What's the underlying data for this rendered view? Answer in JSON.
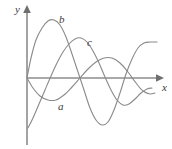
{
  "figure": {
    "title": "",
    "background_color": "#ffffff",
    "axis_color": "#8c8c8c",
    "curve_color": "#8a8a8a",
    "label_color": "#3a3a3a"
  },
  "axes": {
    "x_label": "x",
    "y_label": "y",
    "origin": {
      "x": 27,
      "y": 78
    },
    "x_axis": {
      "start_x": 27,
      "end_x": 163,
      "y": 78,
      "arrow": "right"
    },
    "y_axis": {
      "x": 27,
      "start_y": 145,
      "end_y": 8,
      "arrow": "up"
    }
  },
  "chart_data": {
    "type": "line",
    "title": "",
    "xlabel": "x",
    "ylabel": "y",
    "grid": false,
    "legend": "inline-curve-labels",
    "xlim": [
      0,
      1
    ],
    "ylim": [
      -1,
      1
    ],
    "series": [
      {
        "name": "a",
        "label": "a",
        "label_position": {
          "x": 62,
          "y": 107
        },
        "description": "sine-like curve starting at the origin, first dipping below the x-axis, then rising to a positive hump and decaying toward the right",
        "points_px": [
          [
            27,
            78
          ],
          [
            33,
            88
          ],
          [
            40,
            96
          ],
          [
            48,
            100
          ],
          [
            56,
            100
          ],
          [
            64,
            95
          ],
          [
            72,
            87
          ],
          [
            80,
            78
          ],
          [
            88,
            69
          ],
          [
            96,
            62
          ],
          [
            104,
            58
          ],
          [
            112,
            58
          ],
          [
            120,
            63
          ],
          [
            128,
            72
          ],
          [
            136,
            83
          ],
          [
            143,
            91
          ],
          [
            150,
            94
          ],
          [
            155,
            93
          ]
        ]
      },
      {
        "name": "b",
        "label": "b",
        "label_position": {
          "x": 62,
          "y": 20
        },
        "description": "large-amplitude sine-like curve starting at the origin, rising to a tall first crest, falling to a deep trough, then rising and flattening at a high plateau on the right",
        "points_px": [
          [
            27,
            78
          ],
          [
            31,
            58
          ],
          [
            36,
            40
          ],
          [
            42,
            28
          ],
          [
            48,
            21
          ],
          [
            54,
            20
          ],
          [
            60,
            25
          ],
          [
            66,
            37
          ],
          [
            72,
            54
          ],
          [
            78,
            72
          ],
          [
            84,
            90
          ],
          [
            90,
            108
          ],
          [
            96,
            120
          ],
          [
            102,
            125
          ],
          [
            108,
            122
          ],
          [
            114,
            110
          ],
          [
            120,
            93
          ],
          [
            126,
            74
          ],
          [
            132,
            59
          ],
          [
            138,
            48
          ],
          [
            144,
            43
          ],
          [
            150,
            42
          ],
          [
            157,
            42
          ]
        ]
      },
      {
        "name": "c",
        "label": "c",
        "label_position": {
          "x": 90,
          "y": 43
        },
        "description": "sine-like curve starting low at the left below the axis, rising across the origin region to a crest, falling to a trough and rising again toward the right",
        "points_px": [
          [
            28,
            128
          ],
          [
            33,
            118
          ],
          [
            39,
            104
          ],
          [
            45,
            90
          ],
          [
            51,
            76
          ],
          [
            57,
            63
          ],
          [
            63,
            52
          ],
          [
            69,
            44
          ],
          [
            75,
            39
          ],
          [
            81,
            38
          ],
          [
            87,
            42
          ],
          [
            93,
            51
          ],
          [
            99,
            63
          ],
          [
            105,
            77
          ],
          [
            111,
            90
          ],
          [
            117,
            100
          ],
          [
            123,
            105
          ],
          [
            129,
            104
          ],
          [
            135,
            99
          ],
          [
            141,
            93
          ],
          [
            147,
            89
          ],
          [
            152,
            88
          ]
        ]
      }
    ]
  },
  "curve_labels": {
    "a": "a",
    "b": "b",
    "c": "c"
  }
}
